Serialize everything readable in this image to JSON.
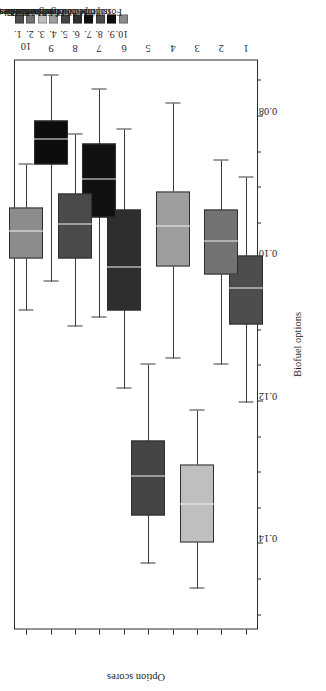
{
  "chart_data": {
    "type": "box",
    "title": "",
    "xlabel": "Biofuel options",
    "ylabel": "Option scores",
    "orientation": "vertical-boxes-rotated",
    "categories": [
      "1",
      "2",
      "3",
      "4",
      "5",
      "6",
      "7",
      "8",
      "9",
      "10"
    ],
    "ylim": [
      0.072,
      0.152
    ],
    "yticks": [
      0.14,
      0.12,
      0.1,
      0.08
    ],
    "ytick_labels": [
      "0.14",
      "0.12",
      "0.10",
      "0.08"
    ],
    "y_axis_inverted": true,
    "grid": false,
    "legend_position": "right",
    "boxes": [
      {
        "category": "1",
        "label": "Ethanol 1G",
        "whisker_low": 0.0885,
        "q1": 0.0995,
        "median": 0.1042,
        "q3": 0.1092,
        "whisker_high": 0.1202,
        "color": "#4d4d4d"
      },
      {
        "category": "2",
        "label": "Biodiesel 1G",
        "whisker_low": 0.0862,
        "q1": 0.093,
        "median": 0.0975,
        "q3": 0.1022,
        "whisker_high": 0.1148,
        "color": "#737373"
      },
      {
        "category": "3",
        "label": "Waste-based biodiesels",
        "whisker_low": 0.1212,
        "q1": 0.1288,
        "median": 0.1345,
        "q3": 0.1398,
        "whisker_high": 0.1462,
        "color": "#bfbfbf"
      },
      {
        "category": "4",
        "label": "Ethanol 2G",
        "whisker_low": 0.0782,
        "q1": 0.0905,
        "median": 0.0955,
        "q3": 0.101,
        "whisker_high": 0.114,
        "color": "#9e9e9e"
      },
      {
        "category": "5",
        "label": "Biodiesel 2G",
        "whisker_low": 0.1148,
        "q1": 0.1255,
        "median": 0.1305,
        "q3": 0.136,
        "whisker_high": 0.1428,
        "color": "#444444"
      },
      {
        "category": "6",
        "label": "Microalgae biodiesel (RW)",
        "whisker_low": 0.0818,
        "q1": 0.093,
        "median": 0.1012,
        "q3": 0.1072,
        "whisker_high": 0.1182,
        "color": "#2e2e2e"
      },
      {
        "category": "7",
        "label": "Microalgae biodiesel (PBR)",
        "whisker_low": 0.0762,
        "q1": 0.0838,
        "median": 0.0888,
        "q3": 0.0942,
        "whisker_high": 0.1082,
        "color": "#111111"
      },
      {
        "category": "8",
        "label": "Imported feedstocks",
        "whisker_low": 0.0825,
        "q1": 0.0908,
        "median": 0.0952,
        "q3": 0.1,
        "whisker_high": 0.1095,
        "color": "#4a4a4a"
      },
      {
        "category": "9",
        "label": "Imported biofuels",
        "whisker_low": 0.0742,
        "q1": 0.0805,
        "median": 0.0832,
        "q3": 0.0868,
        "whisker_high": 0.1032,
        "color": "#0d0d0d"
      },
      {
        "category": "10",
        "label": "Fossil fuel",
        "whisker_low": 0.0868,
        "q1": 0.0928,
        "median": 0.0962,
        "q3": 0.1,
        "whisker_high": 0.1072,
        "color": "#8c8c8c"
      }
    ]
  },
  "legend": {
    "items": [
      {
        "number": "1.",
        "label": "Ethanol 1G",
        "color": "#4d4d4d"
      },
      {
        "number": "2.",
        "label": "Biodiesel 1G",
        "color": "#737373"
      },
      {
        "number": "3.",
        "label": "Waste-based biodiesels",
        "color": "#bfbfbf"
      },
      {
        "number": "4.",
        "label": "Ethanol 2G",
        "color": "#9e9e9e"
      },
      {
        "number": "5.",
        "label": "Biodiesel 2G",
        "color": "#444444"
      },
      {
        "number": "6.",
        "label": "Microalgae biodiesel (RW)",
        "color": "#2e2e2e"
      },
      {
        "number": "7.",
        "label": "Microalgae biodiesel (PBR)",
        "color": "#111111"
      },
      {
        "number": "8.",
        "label": "Imported feedstocks",
        "color": "#4a4a4a"
      },
      {
        "number": "9.",
        "label": "Imported biofuels",
        "color": "#0d0d0d"
      },
      {
        "number": "10.",
        "label": "Fossil fuel",
        "color": "#8c8c8c"
      }
    ]
  },
  "axes": {
    "value_axis_title": "Option scores",
    "category_axis_title": "Biofuel options"
  }
}
